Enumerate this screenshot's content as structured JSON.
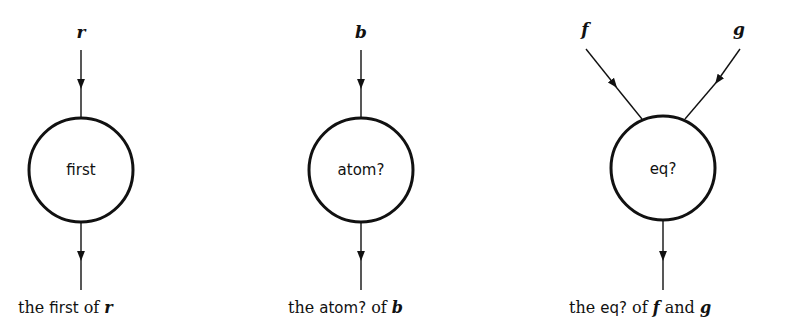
{
  "diagrams": [
    {
      "inputs": [
        "r"
      ],
      "function": "first",
      "caption": {
        "pre": "the ",
        "fn": "first",
        "mid": " of ",
        "arg1": "r",
        "and": "",
        "arg2": ""
      }
    },
    {
      "inputs": [
        "b"
      ],
      "function": "atom?",
      "caption": {
        "pre": "the ",
        "fn": "atom?",
        "mid": " of ",
        "arg1": "b",
        "and": "",
        "arg2": ""
      }
    },
    {
      "inputs": [
        "f",
        "g"
      ],
      "function": "eq?",
      "caption": {
        "pre": "the ",
        "fn": "eq?",
        "mid": " of ",
        "arg1": "f",
        "and": " and ",
        "arg2": "g"
      }
    }
  ]
}
